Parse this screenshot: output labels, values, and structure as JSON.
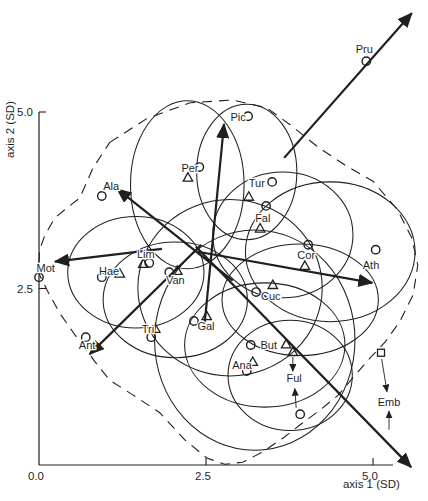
{
  "figure": {
    "kind": "ordination biplot",
    "background": "#ffffff",
    "ink_color": "#1f1f1f",
    "canvas": {
      "width": 428,
      "height": 501
    }
  },
  "chart_data": {
    "type": "scatter",
    "title": "",
    "xlabel": "axis 1 (SD)",
    "ylabel": "axis 2 (SD)",
    "xlim": [
      0.0,
      5.3
    ],
    "ylim": [
      0.0,
      5.0
    ],
    "grid": false,
    "x_ticks": [
      {
        "label": "0.0",
        "value": 0.0
      },
      {
        "label": "2.5",
        "value": 2.5
      },
      {
        "label": "5.0",
        "value": 5.0
      }
    ],
    "y_ticks": [
      {
        "label": "2.5",
        "value": 2.5
      },
      {
        "label": "5.0",
        "value": 5.0
      }
    ],
    "mapping": {
      "x0_px": 39,
      "y0_px": 465,
      "px_per_sd_x": 66.8,
      "px_per_sd_y": 70.6
    },
    "points": [
      {
        "label": "Pru",
        "label_at": [
          4.87,
          5.89
        ],
        "markers": [
          {
            "shape": "circle",
            "x": 4.9,
            "y": 5.72
          }
        ]
      },
      {
        "label": "Pic",
        "label_at": [
          2.98,
          4.93
        ],
        "markers": [
          {
            "shape": "circle",
            "x": 3.13,
            "y": 4.94
          }
        ]
      },
      {
        "label": "Per",
        "label_at": [
          2.26,
          4.21
        ],
        "markers": [
          {
            "shape": "circle",
            "x": 2.4,
            "y": 4.22
          },
          {
            "shape": "triangle",
            "x": 2.23,
            "y": 4.08
          }
        ]
      },
      {
        "label": "Tur",
        "label_at": [
          3.26,
          3.99
        ],
        "markers": [
          {
            "shape": "circle",
            "x": 3.49,
            "y": 4.01
          },
          {
            "shape": "triangle",
            "x": 3.14,
            "y": 3.81
          }
        ]
      },
      {
        "label": "Ala",
        "label_at": [
          1.08,
          3.95
        ],
        "markers": [
          {
            "shape": "circle",
            "x": 0.94,
            "y": 3.81
          }
        ]
      },
      {
        "label": "Fal",
        "label_at": [
          3.35,
          3.5
        ],
        "markers": [
          {
            "shape": "circle",
            "x": 3.4,
            "y": 3.67
          },
          {
            "shape": "triangle",
            "x": 3.31,
            "y": 3.36
          }
        ]
      },
      {
        "label": "Lim",
        "label_at": [
          1.6,
          2.99
        ],
        "markers": [
          {
            "shape": "triangle",
            "x": 1.56,
            "y": 2.86
          },
          {
            "shape": "circle",
            "x": 1.65,
            "y": 2.86
          }
        ]
      },
      {
        "label": "Mot",
        "label_at": [
          0.1,
          2.79
        ],
        "markers": [
          {
            "shape": "circle",
            "x": 0.0,
            "y": 2.66
          }
        ]
      },
      {
        "label": "Hae",
        "label_at": [
          1.05,
          2.75
        ],
        "markers": [
          {
            "shape": "circle",
            "x": 0.94,
            "y": 2.66
          },
          {
            "shape": "triangle",
            "x": 1.21,
            "y": 2.72
          }
        ]
      },
      {
        "label": "Van",
        "label_at": [
          2.04,
          2.62
        ],
        "markers": [
          {
            "shape": "circle",
            "x": 1.95,
            "y": 2.73
          },
          {
            "shape": "triangle",
            "x": 2.07,
            "y": 2.76
          }
        ]
      },
      {
        "label": "Cor",
        "label_at": [
          4.0,
          2.97
        ],
        "markers": [
          {
            "shape": "circle",
            "x": 4.03,
            "y": 3.12
          },
          {
            "shape": "triangle",
            "x": 3.98,
            "y": 2.83
          }
        ]
      },
      {
        "label": "Ath",
        "label_at": [
          4.97,
          2.83
        ],
        "markers": [
          {
            "shape": "circle",
            "x": 5.04,
            "y": 3.05
          }
        ]
      },
      {
        "label": "Cuc",
        "label_at": [
          3.47,
          2.39
        ],
        "markers": [
          {
            "shape": "circle",
            "x": 3.25,
            "y": 2.45
          },
          {
            "shape": "triangle",
            "x": 3.5,
            "y": 2.56
          }
        ]
      },
      {
        "label": "Tri",
        "label_at": [
          1.63,
          1.93
        ],
        "markers": [
          {
            "shape": "triangle",
            "x": 1.74,
            "y": 1.94
          },
          {
            "shape": "circle",
            "x": 1.68,
            "y": 1.81
          }
        ]
      },
      {
        "label": "Ant",
        "label_at": [
          0.72,
          1.7
        ],
        "markers": [
          {
            "shape": "circle",
            "x": 0.7,
            "y": 1.81
          }
        ]
      },
      {
        "label": "Gal",
        "label_at": [
          2.5,
          1.97
        ],
        "markers": [
          {
            "shape": "circle",
            "x": 2.32,
            "y": 2.04
          },
          {
            "shape": "triangle",
            "x": 2.51,
            "y": 2.12
          }
        ]
      },
      {
        "label": "But",
        "label_at": [
          3.44,
          1.7
        ],
        "markers": [
          {
            "shape": "circle",
            "x": 3.17,
            "y": 1.7
          },
          {
            "shape": "triangle",
            "x": 3.7,
            "y": 1.72
          }
        ]
      },
      {
        "label": "Ana",
        "label_at": [
          3.04,
          1.42
        ],
        "markers": [
          {
            "shape": "triangle",
            "x": 3.2,
            "y": 1.47
          },
          {
            "shape": "circle",
            "x": 3.11,
            "y": 1.33
          }
        ]
      },
      {
        "label": "Ful",
        "label_at": [
          3.82,
          1.23
        ],
        "markers": [
          {
            "shape": "triangle",
            "x": 3.8,
            "y": 1.61
          },
          {
            "shape": "circle",
            "x": 3.91,
            "y": 0.72
          }
        ]
      },
      {
        "label": "Emb",
        "label_at": [
          5.24,
          0.89
        ],
        "markers": [
          {
            "shape": "square",
            "x": 5.12,
            "y": 1.59
          }
        ]
      }
    ],
    "vectors": [
      {
        "name": "vector-pru",
        "from": [
          3.67,
          4.35
        ],
        "to": [
          5.58,
          6.4
        ]
      },
      {
        "name": "vector-pic",
        "from": [
          2.47,
          1.91
        ],
        "to": [
          2.77,
          4.83
        ]
      },
      {
        "name": "vector-ala",
        "from": [
          2.9,
          2.61
        ],
        "to": [
          1.17,
          3.91
        ]
      },
      {
        "name": "vector-mot",
        "from": [
          1.84,
          3.06
        ],
        "to": [
          0.24,
          2.88
        ]
      },
      {
        "name": "vector-right",
        "from": [
          2.38,
          3.02
        ],
        "to": [
          4.99,
          2.58
        ]
      },
      {
        "name": "vector-ant",
        "from": [
          2.43,
          3.12
        ],
        "to": [
          0.76,
          1.57
        ]
      },
      {
        "name": "vector-diagonal",
        "from": [
          2.35,
          3.09
        ],
        "to": [
          5.57,
          -0.03
        ]
      }
    ],
    "pointers": [
      {
        "name": "pointer-ful-up",
        "from": [
          3.8,
          1.53
        ],
        "to": [
          3.8,
          1.33
        ]
      },
      {
        "name": "pointer-ful-down",
        "from": [
          3.85,
          0.81
        ],
        "to": [
          3.83,
          1.08
        ]
      },
      {
        "name": "pointer-emb-up",
        "from": [
          5.13,
          1.5
        ],
        "to": [
          5.21,
          1.04
        ]
      },
      {
        "name": "pointer-emb-down",
        "from": [
          5.24,
          0.5
        ],
        "to": [
          5.24,
          0.76
        ]
      }
    ],
    "ellipses": [
      {
        "cx": 2.22,
        "cy": 3.97,
        "rx": 0.85,
        "ry": 1.19
      },
      {
        "cx": 3.11,
        "cy": 4.15,
        "rx": 0.75,
        "ry": 0.96
      },
      {
        "cx": 3.65,
        "cy": 3.26,
        "rx": 1.05,
        "ry": 0.89
      },
      {
        "cx": 4.36,
        "cy": 3.02,
        "rx": 1.27,
        "ry": 0.99
      },
      {
        "cx": 1.45,
        "cy": 2.73,
        "rx": 1.02,
        "ry": 0.79
      },
      {
        "cx": 2.04,
        "cy": 2.34,
        "rx": 1.08,
        "ry": 0.82
      },
      {
        "cx": 2.86,
        "cy": 2.51,
        "rx": 1.38,
        "ry": 1.25
      },
      {
        "cx": 3.38,
        "cy": 1.7,
        "rx": 1.2,
        "ry": 0.88
      },
      {
        "cx": 3.76,
        "cy": 1.27,
        "rx": 0.93,
        "ry": 0.78
      },
      {
        "cx": 3.91,
        "cy": 2.34,
        "rx": 1.17,
        "ry": 0.79
      },
      {
        "cx": 3.23,
        "cy": 1.77,
        "rx": 1.5,
        "ry": 1.56
      }
    ],
    "boundary": [
      [
        1.06,
        4.57
      ],
      [
        1.62,
        4.91
      ],
      [
        2.26,
        5.13
      ],
      [
        2.9,
        5.17
      ],
      [
        3.41,
        5.06
      ],
      [
        3.8,
        4.79
      ],
      [
        4.18,
        4.5
      ],
      [
        4.58,
        4.25
      ],
      [
        5.0,
        4.02
      ],
      [
        5.37,
        3.61
      ],
      [
        5.58,
        3.22
      ],
      [
        5.67,
        2.83
      ],
      [
        5.6,
        2.41
      ],
      [
        5.4,
        2.03
      ],
      [
        5.18,
        1.74
      ],
      [
        4.96,
        1.52
      ],
      [
        4.73,
        1.27
      ],
      [
        4.48,
        0.99
      ],
      [
        4.21,
        0.78
      ],
      [
        3.91,
        0.57
      ],
      [
        3.65,
        0.38
      ],
      [
        3.34,
        0.18
      ],
      [
        3.05,
        0.04
      ],
      [
        2.78,
        0.01
      ],
      [
        2.51,
        0.1
      ],
      [
        2.19,
        0.35
      ],
      [
        1.81,
        0.74
      ],
      [
        1.41,
        0.99
      ],
      [
        1.06,
        1.2
      ],
      [
        0.84,
        1.46
      ],
      [
        0.54,
        1.84
      ],
      [
        0.31,
        2.15
      ],
      [
        0.12,
        2.48
      ],
      [
        -0.01,
        2.73
      ],
      [
        0.01,
        3.05
      ],
      [
        0.09,
        3.26
      ],
      [
        0.24,
        3.5
      ],
      [
        0.43,
        3.65
      ],
      [
        0.61,
        3.78
      ],
      [
        0.81,
        4.21
      ]
    ]
  }
}
